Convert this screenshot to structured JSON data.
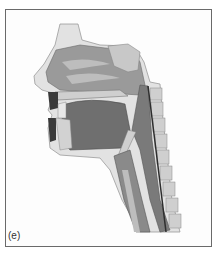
{
  "figure": {
    "panel_label": "(e)",
    "colors": {
      "frame": "#6a6a6a",
      "soft_tissue": "#d6d6d6",
      "cavity": "#8e8e8e",
      "tongue": "#6f6f6f",
      "bone": "#c4c4c4",
      "dark": "#3a3a3a"
    }
  }
}
